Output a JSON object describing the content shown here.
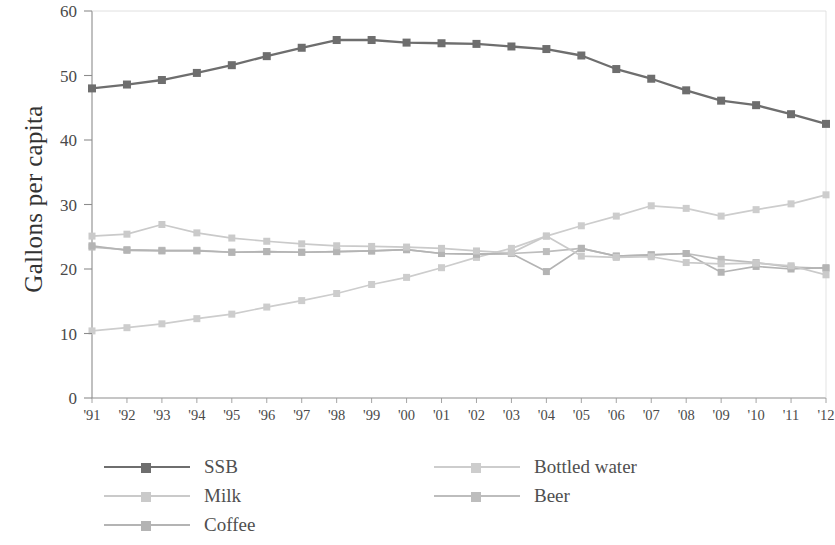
{
  "chart_data": {
    "type": "line",
    "title": "",
    "xlabel": "",
    "ylabel": "Gallons per capita",
    "ylim": [
      0,
      60
    ],
    "yticks": [
      0,
      10,
      20,
      30,
      40,
      50,
      60
    ],
    "grid": false,
    "legend_position": "bottom",
    "categories": [
      "'91",
      "'92",
      "'93",
      "'94",
      "'95",
      "'96",
      "'97",
      "'98",
      "'99",
      "'00",
      "'01",
      "'02",
      "'03",
      "'04",
      "'05",
      "'06",
      "'07",
      "'08",
      "'09",
      "'10",
      "'11",
      "'12"
    ],
    "series": [
      {
        "name": "SSB",
        "color": "#6e6e6e",
        "values": [
          48.0,
          48.6,
          49.3,
          50.4,
          51.6,
          53.0,
          54.3,
          55.5,
          55.5,
          55.1,
          55.0,
          54.9,
          54.5,
          54.1,
          53.1,
          51.0,
          49.5,
          47.7,
          46.1,
          45.4,
          44.0,
          42.5
        ]
      },
      {
        "name": "Milk",
        "color": "#cacaca",
        "values": [
          25.1,
          25.4,
          26.9,
          25.6,
          24.8,
          24.3,
          23.9,
          23.6,
          23.5,
          23.4,
          23.2,
          22.8,
          22.5,
          25.1,
          22.0,
          21.8,
          21.9,
          21.0,
          20.8,
          20.9,
          20.5,
          19.1
        ]
      },
      {
        "name": "Coffee",
        "color": "#b4b4b4",
        "values": [
          23.6,
          22.9,
          22.8,
          22.8,
          22.6,
          22.7,
          22.6,
          22.7,
          22.8,
          23.0,
          22.4,
          22.3,
          22.4,
          19.6,
          23.2,
          22.0,
          22.2,
          22.4,
          19.5,
          20.4,
          20.0,
          20.2
        ]
      },
      {
        "name": "Bottled water",
        "color": "#cdcdcd",
        "values": [
          10.4,
          10.9,
          11.5,
          12.3,
          13.0,
          14.1,
          15.1,
          16.2,
          17.6,
          18.7,
          20.2,
          21.8,
          23.2,
          25.1,
          26.7,
          28.2,
          29.8,
          29.4,
          28.2,
          29.2,
          30.1,
          31.5
        ]
      },
      {
        "name": "Beer",
        "color": "#bdbdbd",
        "values": [
          23.4,
          23.0,
          22.9,
          22.9,
          22.6,
          22.7,
          22.6,
          22.7,
          22.8,
          23.0,
          22.4,
          22.3,
          22.4,
          22.7,
          23.2,
          22.0,
          22.2,
          22.4,
          21.5,
          21.0,
          20.3,
          20.1
        ]
      }
    ]
  },
  "legend": {
    "columns": [
      {
        "entries": [
          "SSB",
          "Milk",
          "Coffee"
        ]
      },
      {
        "entries": [
          "Bottled water",
          "Beer"
        ]
      }
    ]
  }
}
